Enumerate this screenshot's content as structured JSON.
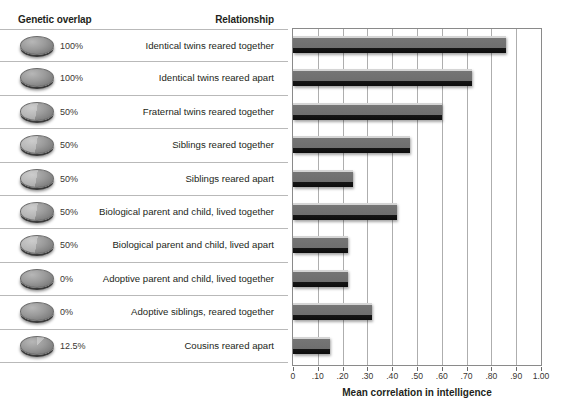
{
  "headers": {
    "genetic_overlap": "Genetic overlap",
    "relationship": "Relationship"
  },
  "chart_data": {
    "type": "bar",
    "orientation": "horizontal",
    "title": "",
    "xlabel": "Mean correlation in intelligence",
    "ylabel": "",
    "xlim": [
      0,
      1.0
    ],
    "grid": true,
    "legend": "none",
    "xticks": [
      0,
      0.1,
      0.2,
      0.3,
      0.4,
      0.5,
      0.6,
      0.7,
      0.8,
      0.9,
      1.0
    ],
    "xtick_labels": [
      "0",
      ".10",
      ".20",
      ".30",
      ".40",
      ".50",
      ".60",
      ".70",
      ".80",
      ".90",
      "1.00"
    ],
    "categories": [
      "Identical twins reared together",
      "Identical twins reared apart",
      "Fraternal twins reared together",
      "Siblings reared together",
      "Siblings reared apart",
      "Biological parent and child, lived together",
      "Biological parent and child, lived apart",
      "Adoptive parent and child, lived together",
      "Adoptive siblings, reared together",
      "Cousins reared apart"
    ],
    "values": [
      0.86,
      0.72,
      0.6,
      0.47,
      0.24,
      0.42,
      0.22,
      0.22,
      0.32,
      0.15
    ],
    "genetic_overlap": [
      "100%",
      "100%",
      "50%",
      "50%",
      "50%",
      "50%",
      "50%",
      "0%",
      "0%",
      "12.5%"
    ],
    "bar_color": "#6e6e6e",
    "grid_color": "#aeaeae"
  },
  "rows": [
    {
      "pct": "100%",
      "label": "Identical twins reared together",
      "value": 0.86,
      "disc": "full"
    },
    {
      "pct": "100%",
      "label": "Identical twins reared apart",
      "value": 0.72,
      "disc": "full"
    },
    {
      "pct": "50%",
      "label": "Fraternal twins reared together",
      "value": 0.6,
      "disc": "half"
    },
    {
      "pct": "50%",
      "label": "Siblings reared together",
      "value": 0.47,
      "disc": "half"
    },
    {
      "pct": "50%",
      "label": "Siblings reared apart",
      "value": 0.24,
      "disc": "half"
    },
    {
      "pct": "50%",
      "label": "Biological parent and child, lived together",
      "value": 0.42,
      "disc": "half"
    },
    {
      "pct": "50%",
      "label": "Biological parent and child, lived apart",
      "value": 0.22,
      "disc": "half"
    },
    {
      "pct": "0%",
      "label": "Adoptive parent and child, lived together",
      "value": 0.22,
      "disc": "none"
    },
    {
      "pct": "0%",
      "label": "Adoptive siblings, reared together",
      "value": 0.32,
      "disc": "none"
    },
    {
      "pct": "12.5%",
      "label": "Cousins reared apart",
      "value": 0.15,
      "disc": "eighth"
    }
  ]
}
